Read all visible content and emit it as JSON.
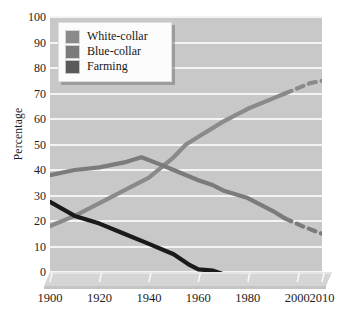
{
  "chart_data": {
    "type": "line",
    "title": "",
    "xlabel": "",
    "ylabel": "Percentage",
    "xlim": [
      1900,
      2010
    ],
    "ylim": [
      0,
      100
    ],
    "grid": true,
    "legend_position": "top-left",
    "x_ticks": [
      "1900",
      "1920",
      "1940",
      "1960",
      "1980",
      "2000",
      "2010"
    ],
    "x_tick_values": [
      1900,
      1920,
      1940,
      1960,
      1980,
      2000,
      2010
    ],
    "y_ticks": [
      "0",
      "10",
      "20",
      "30",
      "40",
      "50",
      "60",
      "70",
      "80",
      "90",
      "100"
    ],
    "y_tick_values": [
      0,
      10,
      20,
      30,
      40,
      50,
      60,
      70,
      80,
      90,
      100
    ],
    "series": [
      {
        "name": "White-collar",
        "color": "#8a8a8a",
        "solid_x": [
          1900,
          1910,
          1920,
          1930,
          1940,
          1950,
          1955,
          1960,
          1970,
          1980,
          1990,
          1995
        ],
        "solid_values": [
          18,
          22,
          27,
          32,
          37,
          45,
          50,
          53,
          59,
          64,
          68,
          70
        ],
        "dashed_x": [
          1995,
          2000,
          2005,
          2010
        ],
        "dashed_values": [
          70,
          72,
          74,
          75
        ]
      },
      {
        "name": "Blue-collar",
        "color": "#7b7b7b",
        "solid_x": [
          1900,
          1910,
          1920,
          1930,
          1937,
          1945,
          1950,
          1960,
          1966,
          1970,
          1980,
          1990,
          1995
        ],
        "solid_values": [
          38,
          40,
          41,
          43,
          45,
          42,
          40,
          36,
          34,
          32,
          29,
          24,
          21
        ],
        "dashed_x": [
          1995,
          2002,
          2010
        ],
        "dashed_values": [
          21,
          18,
          15
        ]
      },
      {
        "name": "Farming",
        "color": "#1a1a1a",
        "solid_x": [
          1900,
          1910,
          1920,
          1930,
          1940,
          1950,
          1956,
          1960,
          1966,
          1972,
          1980,
          1990,
          1995
        ],
        "solid_values": [
          27.5,
          22,
          19,
          15,
          11,
          7,
          3,
          1,
          0.5,
          -1.5,
          -1.5,
          -1.5,
          -1.5
        ],
        "dashed_x": [
          1996,
          2002,
          2010
        ],
        "dashed_values": [
          -1.5,
          -1.5,
          -1.5
        ]
      }
    ]
  },
  "legend": {
    "items": [
      {
        "label": "White-collar",
        "swatch_color": "#8a8a8a"
      },
      {
        "label": "Blue-collar",
        "swatch_color": "#7a7a7a"
      },
      {
        "label": "Farming",
        "swatch_color": "#5a5a5a"
      }
    ]
  },
  "style": {
    "plot_background": "#c8c8c8",
    "gridline_color": "#f4f4f4",
    "base_color": "#d5d5d5"
  }
}
